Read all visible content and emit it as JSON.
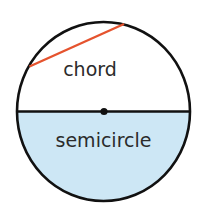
{
  "diagram": {
    "labels": {
      "chord": "chord",
      "semicircle": "semicircle"
    },
    "colors": {
      "circle_stroke": "#111111",
      "chord": "#e5532e",
      "semicircle_fill": "#cde7f5",
      "text": "#2b2b2b",
      "background": "#ffffff"
    }
  }
}
